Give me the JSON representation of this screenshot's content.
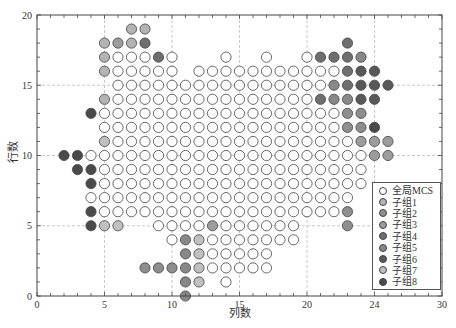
{
  "chart_data": {
    "type": "scatter",
    "title": "",
    "xlabel": "列数",
    "ylabel": "行数",
    "xlim": [
      0,
      30
    ],
    "ylim": [
      0,
      20
    ],
    "xticks": [
      {
        "value": 0,
        "label": "0"
      },
      {
        "value": 5,
        "label": "5"
      },
      {
        "value": 10,
        "label": "10"
      },
      {
        "value": 15,
        "label": "15"
      },
      {
        "value": 20,
        "label": "20"
      },
      {
        "value": 25,
        "label": "24"
      },
      {
        "value": 30,
        "label": "30"
      }
    ],
    "yticks": [
      {
        "value": 0,
        "label": "0"
      },
      {
        "value": 5,
        "label": "5"
      },
      {
        "value": 10,
        "label": "10"
      },
      {
        "value": 15,
        "label": "15"
      },
      {
        "value": 20,
        "label": "20"
      }
    ],
    "grid": true,
    "grid_x": [
      5,
      10,
      15,
      20,
      25
    ],
    "grid_y": [
      5,
      10,
      15
    ],
    "minor_tick_step": 1,
    "legend_position": "lower right",
    "series": [
      {
        "name": "全局MCS",
        "color": "#ffffff",
        "rows": [
          {
            "y": 17,
            "x": [
              6,
              7,
              8,
              10,
              14,
              17,
              20
            ]
          },
          {
            "y": 16,
            "x": [
              6,
              7,
              8,
              9,
              10,
              12,
              13,
              14,
              15,
              16,
              17,
              18,
              19,
              20,
              21,
              22
            ]
          },
          {
            "y": 15,
            "x": [
              6,
              7,
              8,
              9,
              10,
              11,
              12,
              13,
              14,
              15,
              16,
              17,
              18,
              19,
              20,
              21
            ]
          },
          {
            "y": 14,
            "x": [
              6,
              7,
              8,
              9,
              10,
              11,
              12,
              13,
              14,
              15,
              16,
              17,
              18,
              19,
              20
            ]
          },
          {
            "y": 13,
            "x": [
              5,
              6,
              7,
              8,
              9,
              10,
              11,
              12,
              13,
              14,
              15,
              16,
              17,
              18,
              19,
              20,
              21,
              22
            ]
          },
          {
            "y": 12,
            "x": [
              5,
              6,
              7,
              8,
              9,
              10,
              11,
              12,
              13,
              14,
              15,
              16,
              17,
              18,
              19,
              20,
              21,
              22
            ]
          },
          {
            "y": 11,
            "x": [
              6,
              7,
              8,
              9,
              10,
              11,
              12,
              13,
              14,
              15,
              16,
              17,
              18,
              19,
              20,
              21,
              22,
              23
            ]
          },
          {
            "y": 10,
            "x": [
              4,
              5,
              6,
              7,
              8,
              9,
              10,
              11,
              12,
              13,
              14,
              15,
              16,
              17,
              18,
              19,
              20,
              21,
              22,
              23,
              24
            ]
          },
          {
            "y": 9,
            "x": [
              5,
              6,
              7,
              8,
              9,
              10,
              11,
              12,
              13,
              14,
              15,
              16,
              17,
              18,
              19,
              20,
              21,
              22,
              23,
              24
            ]
          },
          {
            "y": 8,
            "x": [
              5,
              6,
              7,
              8,
              9,
              10,
              11,
              12,
              13,
              14,
              15,
              16,
              17,
              18,
              19,
              20,
              21,
              22,
              23,
              24
            ]
          },
          {
            "y": 7,
            "x": [
              4,
              5,
              6,
              7,
              8,
              9,
              10,
              11,
              12,
              13,
              14,
              15,
              16,
              17,
              18,
              19,
              20,
              21,
              22,
              23
            ]
          },
          {
            "y": 6,
            "x": [
              5,
              6,
              7,
              8,
              9,
              10,
              11,
              12,
              13,
              14,
              15,
              16,
              17,
              18,
              19,
              20,
              21,
              22
            ]
          },
          {
            "y": 5,
            "x": [
              9,
              10,
              11,
              12,
              14,
              15,
              16,
              17,
              18,
              19
            ]
          },
          {
            "y": 4,
            "x": [
              10,
              13,
              14,
              15,
              16,
              17,
              18,
              19
            ]
          },
          {
            "y": 3,
            "x": [
              13,
              14,
              15,
              16,
              17
            ]
          },
          {
            "y": 2,
            "x": [
              13,
              14,
              15,
              16,
              17
            ]
          },
          {
            "y": 1,
            "x": [
              14
            ]
          }
        ]
      },
      {
        "name": "子组1",
        "color": "#b3b3b3",
        "rows": [
          {
            "y": 19,
            "x": [
              7,
              8
            ]
          },
          {
            "y": 18,
            "x": [
              5,
              7
            ]
          },
          {
            "y": 17,
            "x": [
              5
            ]
          },
          {
            "y": 16,
            "x": [
              5
            ]
          },
          {
            "y": 14,
            "x": [
              5
            ]
          }
        ]
      },
      {
        "name": "子组2",
        "color": "#8e8e8e",
        "rows": [
          {
            "y": 13,
            "x": [
              23,
              24
            ]
          },
          {
            "y": 12,
            "x": [
              23,
              24
            ]
          },
          {
            "y": 6,
            "x": [
              23
            ]
          },
          {
            "y": 5,
            "x": [
              23
            ]
          },
          {
            "y": 2,
            "x": [
              8,
              9,
              10
            ]
          }
        ]
      },
      {
        "name": "子组3",
        "color": "#9c9c9c",
        "rows": [
          {
            "y": 18,
            "x": [
              6
            ]
          },
          {
            "y": 11,
            "x": [
              24,
              25,
              26
            ]
          },
          {
            "y": 10,
            "x": [
              25,
              26
            ]
          },
          {
            "y": 5,
            "x": [
              13
            ]
          }
        ]
      },
      {
        "name": "子组4",
        "color": "#6e6e6e",
        "rows": [
          {
            "y": 18,
            "x": [
              8,
              23
            ]
          },
          {
            "y": 17,
            "x": [
              9,
              21,
              22,
              23
            ]
          },
          {
            "y": 16,
            "x": [
              23
            ]
          },
          {
            "y": 15,
            "x": [
              23
            ]
          },
          {
            "y": 14,
            "x": [
              21
            ]
          }
        ]
      },
      {
        "name": "子组5",
        "color": "#888888",
        "rows": [
          {
            "y": 17,
            "x": [
              24
            ]
          },
          {
            "y": 15,
            "x": [
              22
            ]
          },
          {
            "y": 14,
            "x": [
              22,
              23
            ]
          },
          {
            "y": 4,
            "x": [
              11
            ]
          },
          {
            "y": 3,
            "x": [
              11
            ]
          },
          {
            "y": 2,
            "x": [
              11
            ]
          },
          {
            "y": 1,
            "x": [
              11
            ]
          },
          {
            "y": 0,
            "x": [
              11
            ]
          }
        ]
      },
      {
        "name": "子组6",
        "color": "#585858",
        "rows": [
          {
            "y": 16,
            "x": [
              24,
              25
            ]
          },
          {
            "y": 15,
            "x": [
              24,
              25,
              26
            ]
          },
          {
            "y": 14,
            "x": [
              24,
              25
            ]
          }
        ]
      },
      {
        "name": "子组7",
        "color": "#c0c0c0",
        "rows": [
          {
            "y": 11,
            "x": [
              5
            ]
          },
          {
            "y": 5,
            "x": [
              5,
              6
            ]
          },
          {
            "y": 4,
            "x": [
              12
            ]
          },
          {
            "y": 3,
            "x": [
              12
            ]
          },
          {
            "y": 2,
            "x": [
              12
            ]
          },
          {
            "y": 1,
            "x": [
              12
            ]
          }
        ]
      },
      {
        "name": "子组8",
        "color": "#4a4a4a",
        "rows": [
          {
            "y": 13,
            "x": [
              4
            ]
          },
          {
            "y": 12,
            "x": [
              25
            ]
          },
          {
            "y": 10,
            "x": [
              2,
              3
            ]
          },
          {
            "y": 9,
            "x": [
              3,
              4
            ]
          },
          {
            "y": 8,
            "x": [
              4
            ]
          },
          {
            "y": 6,
            "x": [
              4
            ]
          },
          {
            "y": 5,
            "x": [
              4
            ]
          }
        ]
      }
    ]
  },
  "style": {
    "frame_color": "#444444",
    "grid_color": "#bbbbbb",
    "marker_edge_color": "#444444"
  }
}
